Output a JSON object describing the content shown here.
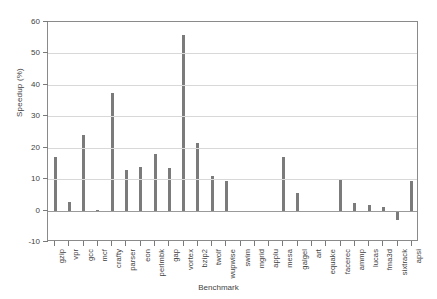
{
  "chart_data": {
    "type": "bar",
    "title": "",
    "xlabel": "Benchmark",
    "ylabel": "Speedup (%)",
    "ylim": [
      -10,
      60
    ],
    "yticks": [
      60,
      50,
      40,
      30,
      20,
      10,
      0,
      -10
    ],
    "grid": true,
    "legend": false,
    "bar_color": "#7b7b7b",
    "categories": [
      "gzip",
      "vpr",
      "gcc",
      "mcf",
      "crafty",
      "parser",
      "eon",
      "perlmbk",
      "gap",
      "vortex",
      "bzip2",
      "twolf",
      "wupwise",
      "swim",
      "mgrid",
      "applu",
      "mesa",
      "galgel",
      "art",
      "equake",
      "facerec",
      "ammp",
      "lucas",
      "fma3d",
      "sixtrack",
      "apsi"
    ],
    "values": [
      17.0,
      2.6,
      24.0,
      0.2,
      37.5,
      13.0,
      14.0,
      18.0,
      13.5,
      56.0,
      21.5,
      11.0,
      9.4,
      -0.4,
      -0.4,
      -0.3,
      17.0,
      5.5,
      -0.4,
      -0.5,
      9.8,
      2.5,
      1.8,
      1.2,
      -3.0,
      9.5
    ]
  }
}
